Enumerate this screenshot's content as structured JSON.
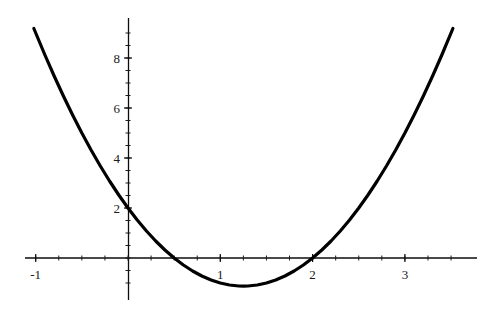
{
  "chart_data": {
    "type": "line",
    "title": "",
    "subtitle": "",
    "xlabel": "",
    "ylabel": "",
    "curve_label": "y = 2x^2 - 5x + 2",
    "xlim": [
      -1.02,
      3.52
    ],
    "ylim": [
      -1.2,
      9.2
    ],
    "grid": false,
    "legend": "none",
    "x_ticks_major": [
      -1,
      1,
      2,
      3
    ],
    "x_tick_labels": [
      "-1",
      "1",
      "2",
      "3"
    ],
    "y_ticks_major": [
      2,
      4,
      6,
      8
    ],
    "y_tick_labels": [
      "2",
      "4",
      "6",
      "8"
    ],
    "x_ticks_minor_step": 0.25,
    "y_ticks_minor_step": 0.5,
    "roots": [
      0.5,
      2
    ],
    "vertex": [
      1.25,
      -1.125
    ],
    "y_intercept": 2,
    "x": [
      -1.02,
      -0.9,
      -0.8,
      -0.7,
      -0.6,
      -0.5,
      -0.4,
      -0.3,
      -0.2,
      -0.1,
      0,
      0.1,
      0.2,
      0.3,
      0.4,
      0.5,
      0.6,
      0.7,
      0.8,
      0.9,
      1,
      1.1,
      1.2,
      1.25,
      1.3,
      1.4,
      1.5,
      1.6,
      1.7,
      1.8,
      1.9,
      2,
      2.1,
      2.2,
      2.3,
      2.4,
      2.5,
      2.6,
      2.7,
      2.8,
      2.9,
      3,
      3.1,
      3.2,
      3.3,
      3.4,
      3.52
    ],
    "y": [
      9.18,
      8.12,
      7.28,
      6.48,
      5.72,
      5.0,
      4.32,
      3.68,
      3.08,
      2.52,
      2.0,
      1.52,
      1.08,
      0.68,
      0.32,
      0.0,
      -0.28,
      -0.52,
      -0.72,
      -0.88,
      -1.0,
      -1.08,
      -1.12,
      -1.125,
      -1.12,
      -1.08,
      -1.0,
      -0.88,
      -0.72,
      -0.52,
      -0.28,
      0.0,
      0.32,
      0.68,
      1.08,
      1.52,
      2.0,
      2.52,
      3.08,
      3.68,
      4.32,
      5.0,
      5.72,
      6.48,
      7.28,
      8.12,
      9.18
    ],
    "series": [
      {
        "name": "y = 2x^2 - 5x + 2",
        "color": "#000000",
        "line_width": 3.2,
        "style": "solid"
      }
    ],
    "axis_color": "#000000",
    "background_color": "#ffffff"
  },
  "axes": {
    "x_axis_name": "x-axis",
    "y_axis_name": "y-axis",
    "x_axis_pixel_range": [
      25,
      477
    ],
    "y_axis_pixel_range": [
      18,
      300
    ],
    "origin_pixel": [
      128,
      258
    ]
  }
}
